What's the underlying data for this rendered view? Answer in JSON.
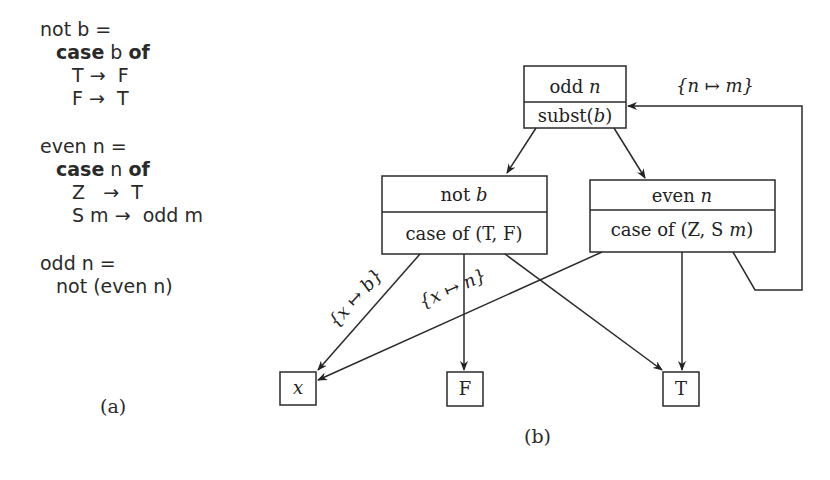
{
  "panel_a": {
    "caption": "(a)",
    "lines": [
      {
        "indent": 0,
        "parts": [
          {
            "t": "not b =",
            "b": false
          }
        ]
      },
      {
        "indent": 1,
        "parts": [
          {
            "t": "case",
            "b": true
          },
          {
            "t": " b ",
            "b": false
          },
          {
            "t": "of",
            "b": true
          }
        ]
      },
      {
        "indent": 2,
        "parts": [
          {
            "t": "T →  F",
            "b": false
          }
        ]
      },
      {
        "indent": 2,
        "parts": [
          {
            "t": "F →  T",
            "b": false
          }
        ]
      },
      {
        "indent": 0,
        "parts": [
          {
            "t": "even n =",
            "b": false
          }
        ]
      },
      {
        "indent": 1,
        "parts": [
          {
            "t": "case",
            "b": true
          },
          {
            "t": " n ",
            "b": false
          },
          {
            "t": "of",
            "b": true
          }
        ]
      },
      {
        "indent": 2,
        "parts": [
          {
            "t": "Z   →  T",
            "b": false
          }
        ]
      },
      {
        "indent": 2,
        "parts": [
          {
            "t": "S m →  odd m",
            "b": false
          }
        ]
      },
      {
        "indent": 0,
        "parts": [
          {
            "t": "odd n =",
            "b": false
          }
        ]
      },
      {
        "indent": 1,
        "parts": [
          {
            "t": "not (even n)",
            "b": false
          }
        ]
      }
    ],
    "line_tops": [
      18,
      41,
      64,
      87,
      135,
      158,
      181,
      204,
      252,
      275
    ]
  },
  "panel_b": {
    "caption": "(b)",
    "nodes": {
      "odd": {
        "top": "odd ",
        "top_var": "n",
        "bottom": "subst(",
        "bottom_var": "b",
        "bottom_end": ")"
      },
      "not": {
        "top": "not ",
        "top_var": "b",
        "bottom": "case of (T, F)"
      },
      "even": {
        "top": "even ",
        "top_var": "n",
        "bottom": "case of (Z, S ",
        "bottom_var": "m",
        "bottom_end": ")"
      },
      "x": {
        "label": "x"
      },
      "F": {
        "label": "F"
      },
      "T": {
        "label": "T"
      }
    },
    "edge_labels": {
      "loop": "{n ↦ m}",
      "x_b": "{x ↦ b}",
      "x_n": "{x ↦ n}"
    }
  }
}
